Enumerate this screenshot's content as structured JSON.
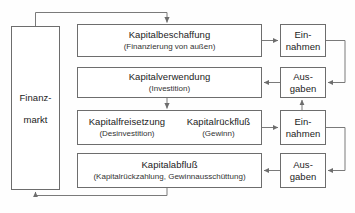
{
  "diagram": {
    "nodes": {
      "finanzmarkt": {
        "line1": "Finanz-",
        "line2": "markt"
      },
      "kapitalbeschaffung": {
        "title": "Kapitalbeschaffung",
        "sub": "(Finanzierung von außen)"
      },
      "kapitalverwendung": {
        "title": "Kapitalverwendung",
        "sub": "(Investition)"
      },
      "kapitalfreisetzung": {
        "title": "Kapitalfreisetzung",
        "sub": "(Desinvestition)"
      },
      "kapitalrueckfluss": {
        "title": "Kapitalrückfluß",
        "sub": "(Gewinn)"
      },
      "kapitalabfluss": {
        "title": "Kapitalabfluß",
        "sub": "(Kapitalrückzahlung, Gewinnausschüttung)"
      },
      "einnahmen_1": {
        "line1": "Ein-",
        "line2": "nahmen"
      },
      "ausgaben_1": {
        "line1": "Aus-",
        "line2": "gaben"
      },
      "einnahmen_2": {
        "line1": "Ein-",
        "line2": "nahmen"
      },
      "ausgaben_2": {
        "line1": "Aus-",
        "line2": "gaben"
      }
    },
    "colors": {
      "stroke": "#6d6d6d",
      "wire": "#7a7a7a",
      "text": "#1b1b1b",
      "subtext": "#333333",
      "background": "#fefefe"
    },
    "edges": [
      {
        "name": "finanzmarkt-to-kapitalbeschaffung",
        "from": "finanzmarkt",
        "to": "kapitalbeschaffung",
        "arrow": "down"
      },
      {
        "name": "kapitalbeschaffung-to-einnahmen-1",
        "from": "kapitalbeschaffung",
        "to": "einnahmen_1",
        "arrow": "right"
      },
      {
        "name": "einnahmen-1-to-ausgaben-1",
        "from": "einnahmen_1",
        "to": "ausgaben_1",
        "arrow": "left"
      },
      {
        "name": "ausgaben-1-to-kapitalverwendung",
        "from": "ausgaben_1",
        "to": "kapitalverwendung",
        "arrow": "left"
      },
      {
        "name": "kapitalverwendung-to-kapitalfreisetzung",
        "from": "kapitalverwendung",
        "to": "kapitalfreisetzung",
        "arrow": "down"
      },
      {
        "name": "kapitalrueckfluss-to-einnahmen-2",
        "from": "kapitalrueckfluss",
        "to": "einnahmen_2",
        "arrow": "right"
      },
      {
        "name": "einnahmen-2-to-ausgaben-1",
        "from": "einnahmen_2",
        "to": "ausgaben_1",
        "arrow": "up"
      },
      {
        "name": "einnahmen-2-to-ausgaben-2",
        "from": "einnahmen_2",
        "to": "ausgaben_2",
        "arrow": "left"
      },
      {
        "name": "ausgaben-2-to-kapitalabfluss",
        "from": "ausgaben_2",
        "to": "kapitalabfluss",
        "arrow": "left"
      },
      {
        "name": "kapitalabfluss-to-finanzmarkt",
        "from": "kapitalabfluss",
        "to": "finanzmarkt",
        "arrow": "up"
      }
    ]
  }
}
